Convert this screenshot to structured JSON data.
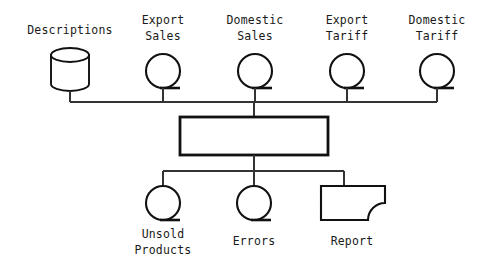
{
  "diagram": {
    "background_color": "#ffffff",
    "line_color": "#111111",
    "connector_color": "#333333",
    "inputs": [
      {
        "id": "descriptions",
        "label": "Descriptions",
        "label_line1": "Descriptions",
        "label_line2": "",
        "symbol": "cylinder-storage-icon"
      },
      {
        "id": "export-sales",
        "label": "Export Sales",
        "label_line1": "Export",
        "label_line2": "Sales",
        "symbol": "magnetic-tape-icon"
      },
      {
        "id": "domestic-sales",
        "label": "Domestic Sales",
        "label_line1": "Domestic",
        "label_line2": "Sales",
        "symbol": "magnetic-tape-icon"
      },
      {
        "id": "export-tariff",
        "label": "Export Tariff",
        "label_line1": "Export",
        "label_line2": "Tariff",
        "symbol": "magnetic-tape-icon"
      },
      {
        "id": "domestic-tariff",
        "label": "Domestic Tariff",
        "label_line1": "Domestic",
        "label_line2": "Tariff",
        "symbol": "magnetic-tape-icon"
      }
    ],
    "process": {
      "id": "main-process",
      "label": "",
      "symbol": "process-box-icon"
    },
    "outputs": [
      {
        "id": "unsold-products",
        "label": "Unsold Products",
        "label_line1": "Unsold",
        "label_line2": "Products",
        "symbol": "magnetic-tape-icon"
      },
      {
        "id": "errors",
        "label": "Errors",
        "label_line1": "Errors",
        "label_line2": "",
        "symbol": "magnetic-tape-icon"
      },
      {
        "id": "report",
        "label": "Report",
        "label_line1": "Report",
        "label_line2": "",
        "symbol": "document-report-icon"
      }
    ]
  }
}
